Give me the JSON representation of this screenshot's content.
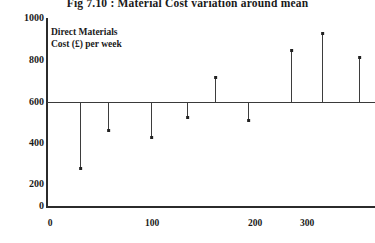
{
  "chart_data": {
    "type": "bar",
    "title": "Fig 7.10 : Material Cost variation around mean",
    "xlabel": "",
    "ylabel": "",
    "annotation": "Direct Materials\nCost (£) per week",
    "mean": 600,
    "grid": false,
    "legend": null,
    "xlim": [
      0,
      380
    ],
    "ylim": [
      0,
      1000
    ],
    "xticks": [
      0,
      100,
      200,
      300
    ],
    "yticks": [
      0,
      200,
      400,
      600,
      800,
      1000
    ],
    "xtick_labels": [
      "0",
      "100",
      "200",
      "300"
    ],
    "ytick_labels": [
      "0",
      "200",
      "400",
      "600",
      "800",
      "1000"
    ],
    "x": [
      35,
      68,
      118,
      160,
      193,
      232,
      285,
      321,
      364
    ],
    "values": [
      205,
      415,
      380,
      490,
      720,
      515,
      850,
      930,
      820
    ],
    "series": [
      {
        "name": "Direct Materials Cost (£) per week",
        "values": [
          205,
          415,
          380,
          490,
          720,
          515,
          850,
          930,
          820
        ]
      }
    ],
    "points": [
      {
        "x": 35,
        "y": 205,
        "px": 80,
        "py": 168,
        "direction": "below"
      },
      {
        "x": 68,
        "y": 415,
        "px": 108,
        "py": 130,
        "direction": "below"
      },
      {
        "x": 118,
        "y": 380,
        "px": 151,
        "py": 137,
        "direction": "below"
      },
      {
        "x": 160,
        "y": 490,
        "px": 187,
        "py": 117,
        "direction": "below"
      },
      {
        "x": 193,
        "y": 720,
        "px": 215,
        "py": 77,
        "direction": "above"
      },
      {
        "x": 232,
        "y": 515,
        "px": 248,
        "py": 120,
        "direction": "below"
      },
      {
        "x": 285,
        "y": 850,
        "px": 291,
        "py": 50,
        "direction": "above"
      },
      {
        "x": 321,
        "y": 930,
        "px": 322,
        "py": 33,
        "direction": "above"
      },
      {
        "x": 364,
        "y": 820,
        "px": 359,
        "py": 57,
        "direction": "above"
      }
    ],
    "colors": {
      "axis": "#2b2b2b",
      "stem": "#3d3d3d",
      "marker": "#222222",
      "mean_line": "#3a3a3a",
      "background": "#ffffff",
      "text": "#1a1a1a"
    }
  },
  "xtick_px": [
    50,
    152,
    255,
    307
  ],
  "ytick_px": [
    206,
    184,
    143,
    102,
    60,
    18
  ]
}
